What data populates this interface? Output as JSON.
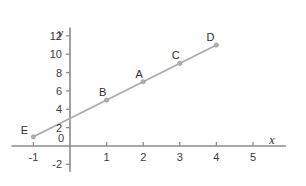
{
  "chart_data": {
    "type": "scatter",
    "title": "",
    "xlabel": "x",
    "ylabel": "y",
    "xlim": [
      -1.6,
      5.9
    ],
    "ylim": [
      -2.8,
      12.9
    ],
    "grid": false,
    "legend": "none",
    "x_ticks": [
      "-1",
      "0",
      "1",
      "2",
      "3",
      "4",
      "5"
    ],
    "x_tick_values": [
      -1,
      0,
      1,
      2,
      3,
      4,
      5
    ],
    "y_ticks": [
      "-2",
      "0",
      "2",
      "4",
      "6",
      "8",
      "10",
      "12"
    ],
    "y_tick_values": [
      -2,
      0,
      2,
      4,
      6,
      8,
      10,
      12
    ],
    "origin_label": "0",
    "line": {
      "name": "line through plotted points",
      "slope": 2,
      "intercept": 3,
      "x_start": -1,
      "x_end": 4,
      "color": "#a9a9a9"
    },
    "points": [
      {
        "label": "E",
        "x": -1,
        "y": 1,
        "label_dx": -9,
        "label_dy": -12
      },
      {
        "label": "B",
        "x": 1,
        "y": 5,
        "label_dx": -4,
        "label_dy": -13
      },
      {
        "label": "A",
        "x": 2,
        "y": 7,
        "label_dx": -4,
        "label_dy": -13
      },
      {
        "label": "C",
        "x": 3,
        "y": 9,
        "label_dx": -4,
        "label_dy": -13
      },
      {
        "label": "D",
        "x": 4,
        "y": 11,
        "label_dx": -6,
        "label_dy": -13
      }
    ],
    "point_color": "#b0b0b0",
    "axis_color": "#8c8c8c",
    "text_color": "#2e2e2e",
    "background": "#ffffff"
  }
}
